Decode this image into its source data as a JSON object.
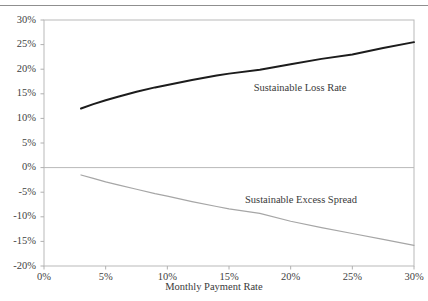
{
  "figure": {
    "top_divider_clipped_text": "",
    "width": 428,
    "height": 301
  },
  "chart_data": {
    "type": "line",
    "title": "",
    "xlabel": "Monthly Payment Rate",
    "ylabel": "",
    "xlim": [
      0,
      30
    ],
    "ylim": [
      -20,
      30
    ],
    "grid": false,
    "legend_position": "inline-annotation",
    "x_tick_labels": [
      "0%",
      "5%",
      "10%",
      "15%",
      "20%",
      "25%",
      "30%"
    ],
    "x_ticks": [
      0,
      5,
      10,
      15,
      20,
      25,
      30
    ],
    "y_tick_labels": [
      "30%",
      "25%",
      "20%",
      "15%",
      "10%",
      "5%",
      "0%",
      "-5%",
      "-10%",
      "-15%",
      "-20%"
    ],
    "y_ticks": [
      30,
      25,
      20,
      15,
      10,
      5,
      0,
      -5,
      -10,
      -15,
      -20
    ],
    "zero_line": 0,
    "series": [
      {
        "name": "Sustainable Loss Rate",
        "color": "#1c1c1c",
        "width": 2.0,
        "label_x": 17.0,
        "label_y": 16.2,
        "x": [
          3.0,
          4.0,
          5.0,
          6.0,
          7.5,
          9.0,
          10.0,
          12.0,
          14.0,
          15.0,
          17.5,
          20.0,
          22.5,
          25.0,
          27.5,
          30.0
        ],
        "y": [
          12.0,
          12.9,
          13.7,
          14.4,
          15.4,
          16.3,
          16.8,
          17.8,
          18.7,
          19.1,
          19.9,
          21.0,
          22.1,
          23.0,
          24.3,
          25.5
        ]
      },
      {
        "name": "Sustainable Excess Spread",
        "color": "#a6a6a6",
        "width": 1.2,
        "label_x": 16.3,
        "label_y": -6.6,
        "x": [
          3.0,
          4.0,
          5.0,
          6.0,
          7.5,
          9.0,
          10.0,
          12.0,
          14.0,
          15.0,
          17.5,
          20.0,
          22.5,
          25.0,
          27.5,
          30.0
        ],
        "y": [
          -1.5,
          -2.2,
          -2.9,
          -3.5,
          -4.4,
          -5.3,
          -5.8,
          -6.9,
          -7.9,
          -8.4,
          -9.3,
          -10.9,
          -12.2,
          -13.4,
          -14.6,
          -15.8
        ]
      }
    ]
  }
}
